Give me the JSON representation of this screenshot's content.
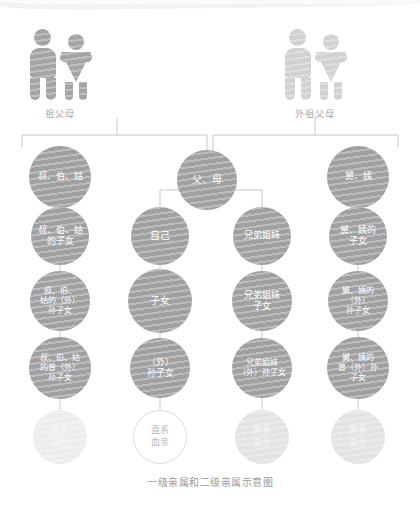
{
  "caption": "一级亲属和二级亲属示意图",
  "colors": {
    "node_fill": "#9fa0a1",
    "node_fill_dark": "#989a9b",
    "node_text": "#ffffff",
    "icon_dark": "#a2a4a5",
    "icon_light": "#cfd1d2",
    "line": "#c9cacb",
    "label_text": "#a8a9aa",
    "caption_text": "#9b9b9b",
    "legend_fill": "#e2e3e4",
    "legend_fill_faint": "#ededee",
    "legend_text": "#f6f6f6",
    "legend_outline": "#dcdddd",
    "legend_outline_text": "#b9babb",
    "background": "#ffffff"
  },
  "icon_groups": [
    {
      "name": "paternal-grandparents",
      "label": "祖父母",
      "tone": "dark",
      "figures": [
        {
          "icon": "man-icon",
          "sex": "male"
        },
        {
          "icon": "woman-icon",
          "sex": "female"
        }
      ]
    },
    {
      "name": "maternal-grandparents",
      "label": "外祖父母",
      "tone": "light",
      "figures": [
        {
          "icon": "man-icon",
          "sex": "male"
        },
        {
          "icon": "woman-icon",
          "sex": "female"
        }
      ]
    }
  ],
  "columns": [
    {
      "key": "col-uncle-paternal",
      "center_x": 60
    },
    {
      "key": "col-self",
      "center_x": 160
    },
    {
      "key": "col-sibling",
      "center_x": 262
    },
    {
      "key": "col-uncle-maternal",
      "center_x": 358
    }
  ],
  "nodes": [
    {
      "id": "n-fu-mu",
      "label": "父、母",
      "col": 1,
      "row": 1,
      "cx": 207,
      "cy": 180,
      "r": 30,
      "size": 10
    },
    {
      "id": "n-shu-bo-gu",
      "label": "叔、伯、姑",
      "col": 0,
      "row": 1,
      "cx": 60,
      "cy": 177,
      "r": 31,
      "size": 9
    },
    {
      "id": "n-jiu-yi",
      "label": "舅、姨",
      "col": 3,
      "row": 1,
      "cx": 358,
      "cy": 177,
      "r": 31,
      "size": 9
    },
    {
      "id": "n-shu-bo-gu-zinv",
      "label": "叔、伯、姑\n的子女",
      "col": 0,
      "row": 2,
      "cx": 60,
      "cy": 236,
      "r": 29,
      "size": 9
    },
    {
      "id": "n-ziji",
      "label": "自己",
      "col": 1,
      "row": 2,
      "cx": 160,
      "cy": 236,
      "r": 29,
      "size": 10
    },
    {
      "id": "n-xiongdi-jiemei",
      "label": "兄弟姐妹",
      "col": 2,
      "row": 2,
      "cx": 262,
      "cy": 236,
      "r": 29,
      "size": 9
    },
    {
      "id": "n-jiu-yi-zinv",
      "label": "舅、姨的\n子女",
      "col": 3,
      "row": 2,
      "cx": 358,
      "cy": 236,
      "r": 29,
      "size": 9
    },
    {
      "id": "n-shu-bo-gu-sun",
      "label": "叔、伯、\n姑的（外）\n孙子女",
      "col": 0,
      "row": 3,
      "cx": 60,
      "cy": 301,
      "r": 30,
      "size": 8
    },
    {
      "id": "n-zinv",
      "label": "子女",
      "col": 1,
      "row": 3,
      "cx": 160,
      "cy": 301,
      "r": 32,
      "size": 10
    },
    {
      "id": "n-xiongdi-jiemei-zinv",
      "label": "兄弟姐妹\n子女",
      "col": 2,
      "row": 3,
      "cx": 262,
      "cy": 301,
      "r": 30,
      "size": 9
    },
    {
      "id": "n-jiu-yi-sun",
      "label": "舅、姨的\n（外）\n孙子女",
      "col": 3,
      "row": 3,
      "cx": 358,
      "cy": 301,
      "r": 30,
      "size": 8
    },
    {
      "id": "n-shu-bo-gu-zengsun",
      "label": "叔、伯、姑\n的曾（外）\n孙子女",
      "col": 0,
      "row": 4,
      "cx": 60,
      "cy": 368,
      "r": 31,
      "size": 8
    },
    {
      "id": "n-wai-sunzinv",
      "label": "（外）\n孙子女",
      "col": 1,
      "row": 4,
      "cx": 160,
      "cy": 368,
      "r": 30,
      "size": 9
    },
    {
      "id": "n-xiongdi-jiemei-sun",
      "label": "兄弟姐妹\n（外）孙子女",
      "col": 2,
      "row": 4,
      "cx": 262,
      "cy": 368,
      "r": 30,
      "size": 8
    },
    {
      "id": "n-jiu-yi-zengsun",
      "label": "舅、姨的\n曾（外）孙\n子女",
      "col": 3,
      "row": 4,
      "cx": 358,
      "cy": 368,
      "r": 31,
      "size": 8
    }
  ],
  "legend": [
    {
      "id": "lg-pangxi-1",
      "label": "旁系\n血亲",
      "cx": 60,
      "cy": 437,
      "r": 27,
      "style": "faint"
    },
    {
      "id": "lg-zhixi",
      "label": "直系\n血亲",
      "cx": 160,
      "cy": 437,
      "r": 27,
      "style": "outline"
    },
    {
      "id": "lg-pangxi-2",
      "label": "旁系\n血亲",
      "cx": 262,
      "cy": 437,
      "r": 27,
      "style": "solid"
    },
    {
      "id": "lg-pangxi-3",
      "label": "旁系\n血亲",
      "cx": 358,
      "cy": 437,
      "r": 27,
      "style": "solid"
    }
  ],
  "links": {
    "grandparent_bus_y": 135,
    "grandparent_bus_left_x": 22,
    "grandparent_bus_right_x": 398,
    "paternal_drop_x": 117,
    "maternal_drop_x": 315,
    "split_x": 210,
    "parent_bus_y": 190,
    "parent_bus_left_x": 160,
    "parent_bus_right_x": 262
  }
}
